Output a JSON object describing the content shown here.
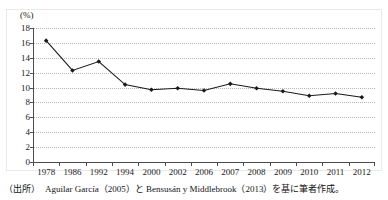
{
  "figure": {
    "unit_label": "(%)",
    "title_remnant": "",
    "source_note": "（出所）　Aguilar García（2005）と Bensusán y Middlebrook（2013）を基に筆者作成。"
  },
  "chart_data": {
    "type": "line",
    "title": "",
    "xlabel": "",
    "ylabel": "(%)",
    "ylim": [
      0,
      18
    ],
    "ytick_step": 2,
    "yticks": [
      18,
      16,
      14,
      12,
      10,
      8,
      6,
      4,
      2,
      0
    ],
    "grid": true,
    "legend": "none",
    "marker": "diamond",
    "line_color": "#1a1a1a",
    "marker_color": "#1a1a1a",
    "categories": [
      "1978",
      "1986",
      "1992",
      "1994",
      "2000",
      "2002",
      "2006",
      "2007",
      "2008",
      "2009",
      "2010",
      "2011",
      "2012"
    ],
    "values": [
      16.3,
      12.3,
      13.5,
      10.4,
      9.7,
      9.9,
      9.6,
      10.5,
      9.9,
      9.5,
      8.9,
      9.2,
      8.7
    ]
  }
}
